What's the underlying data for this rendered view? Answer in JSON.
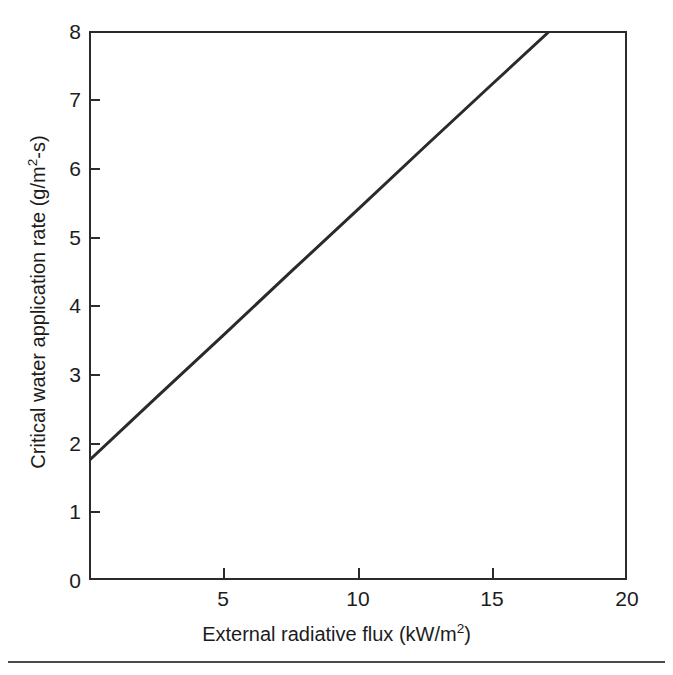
{
  "figure": {
    "background_color": "#ffffff",
    "frame_color": "#2b2b2b",
    "line_color": "#2a2a2a"
  },
  "axis_titles": {
    "x_prefix": "External radiative flux (kW/m",
    "x_exponent": "2",
    "x_suffix": ")",
    "y_prefix": "Critical water application rate (g/m",
    "y_exponent": "2",
    "y_suffix": "-s)"
  },
  "y_ticks": [
    {
      "label": "0",
      "value": 0
    },
    {
      "label": "1",
      "value": 1
    },
    {
      "label": "2",
      "value": 2
    },
    {
      "label": "3",
      "value": 3
    },
    {
      "label": "4",
      "value": 4
    },
    {
      "label": "5",
      "value": 5
    },
    {
      "label": "6",
      "value": 6
    },
    {
      "label": "7",
      "value": 7
    },
    {
      "label": "8",
      "value": 8
    }
  ],
  "x_ticks": [
    {
      "label": "0",
      "value": 0
    },
    {
      "label": "5",
      "value": 5
    },
    {
      "label": "10",
      "value": 10
    },
    {
      "label": "15",
      "value": 15
    },
    {
      "label": "20",
      "value": 20
    }
  ],
  "chart_data": {
    "type": "line",
    "title": "",
    "subtitle": "",
    "xlabel": "External radiative flux (kW/m2)",
    "ylabel": "Critical water application rate (g/m2-s)",
    "xlim": [
      0,
      20
    ],
    "ylim": [
      0,
      8
    ],
    "xticks": [
      0,
      5,
      10,
      15,
      20
    ],
    "yticks": [
      0,
      1,
      2,
      3,
      4,
      5,
      6,
      7,
      8
    ],
    "grid": false,
    "legend": null,
    "legend_position": "none",
    "annotations": [],
    "series": [
      {
        "name": "Critical water application rate",
        "style": "solid",
        "color": "#2a2a2a",
        "width_px": 3,
        "x": [
          0,
          2.5,
          5,
          7.5,
          10,
          12.5,
          15,
          17.1
        ],
        "y": [
          1.75,
          2.67,
          3.58,
          4.5,
          5.41,
          6.33,
          7.24,
          8.0
        ],
        "fit": {
          "intercept": 1.75,
          "slope": 0.3655,
          "x_start": 0,
          "x_end": 17.1,
          "y_start": 1.75,
          "y_end": 8.0
        }
      }
    ]
  }
}
